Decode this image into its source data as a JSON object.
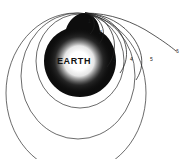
{
  "figure": {
    "background_color": "#ffffff",
    "line_color": "#2b2b2b",
    "body_color": "#0d0d0d",
    "glow_color": "#ffffff"
  },
  "earth": {
    "label": "EARTH",
    "center_x": 80,
    "center_y": 61,
    "radius": 36,
    "label_color": "#111111"
  },
  "launch_point": {
    "x": 85,
    "y": 13,
    "description": "common tangent point where all trajectories originate"
  },
  "trajectories": [
    {
      "id": 1,
      "label": "1",
      "label_x": 88,
      "label_y": 19,
      "type": "suborbital",
      "description": "shortest ballistic arc falling back to Earth"
    },
    {
      "id": 2,
      "label": "2",
      "label_x": 99,
      "label_y": 30,
      "type": "suborbital",
      "description": "longer ballistic arc falling back to Earth"
    },
    {
      "id": 3,
      "label": "3",
      "label_x": 113,
      "label_y": 61,
      "type": "orbit",
      "description": "closed elliptical orbit"
    },
    {
      "id": 4,
      "label": "4",
      "label_x": 130,
      "label_y": 60,
      "type": "orbit",
      "description": "larger closed elliptical orbit"
    },
    {
      "id": 5,
      "label": "5",
      "label_x": 150,
      "label_y": 60,
      "type": "orbit",
      "description": "largest closed elliptical orbit"
    },
    {
      "id": 6,
      "label": "6",
      "label_x": 176,
      "label_y": 52,
      "type": "escape",
      "description": "open escape trajectory leaving Earth"
    }
  ],
  "orbit_circles": [
    {
      "id": "orbit-small",
      "cx": 80,
      "cy": 61,
      "rx": 44,
      "ry": 47
    },
    {
      "id": "orbit-medium",
      "cx": 78,
      "cy": 76,
      "rx": 57,
      "ry": 63
    },
    {
      "id": "orbit-large",
      "cx": 76,
      "cy": 93,
      "rx": 70,
      "ry": 80
    }
  ]
}
